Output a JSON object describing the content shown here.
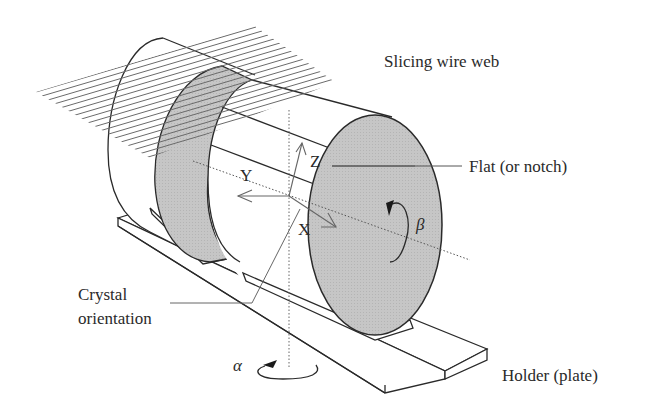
{
  "figure": {
    "type": "technical-illustration",
    "colors": {
      "background": "#ffffff",
      "line": "#2a2a2a",
      "face_fill": "#c4c4c4",
      "wire": "#6a6a6a",
      "axis_dotted": "#555555"
    }
  },
  "labels": {
    "wire_web": "Slicing wire web",
    "flat": "Flat (or notch)",
    "crystal_orientation_line1": "Crystal",
    "crystal_orientation_line2": "orientation",
    "holder": "Holder (plate)"
  },
  "axes": {
    "x": "X",
    "y": "Y",
    "z": "Z",
    "alpha": "α",
    "beta": "β"
  },
  "wire_web": {
    "wire_count": 19
  }
}
